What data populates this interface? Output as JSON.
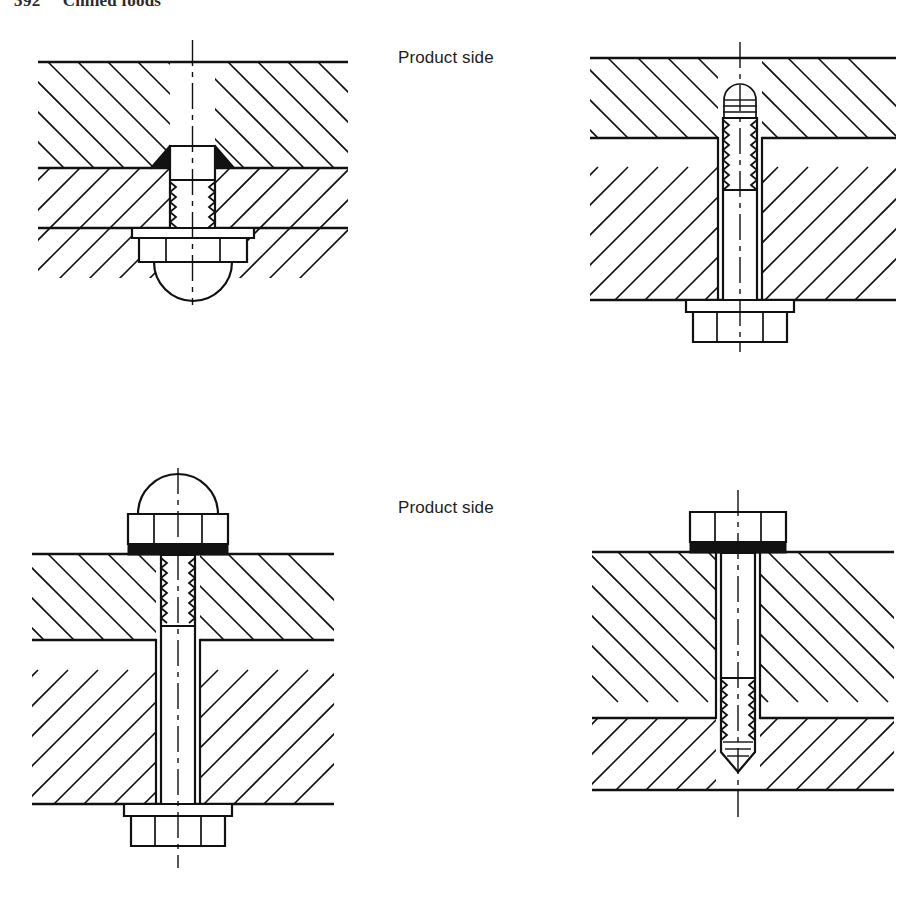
{
  "page": {
    "width": 911,
    "height": 902,
    "background": "#ffffff",
    "ink": "#111111",
    "seal_color": "#121212"
  },
  "running_head": {
    "folio": "392",
    "title": "Chilled foods"
  },
  "captions": {
    "top": "Product side",
    "bottom": "Product side"
  },
  "figures": [
    {
      "id": "top-left",
      "name": "countersunk-bolt-through-joint",
      "description": "Countersunk screw set flush with the product surface, sealing compound filling the countersink, threaded shank engaging a flanged domed cap nut on the underside.",
      "product_side": "top",
      "fastener": "countersunk screw",
      "head_type": "countersunk flush head",
      "nut_type": "flanged hexagon domed cap nut",
      "nut_position": "bottom",
      "sealing": "black sealing compound in countersink",
      "blind_hole": false,
      "hygienic": true
    },
    {
      "id": "top-right",
      "name": "stud-recessed-below-surface",
      "description": "Stud terminating below the product surface inside the upper plate with its rounded thread end set down in a blind recess, plain shank through the lower plate and a flanged hexagon nut beneath.",
      "product_side": "top",
      "fastener": "stud",
      "head_type": "rounded thread end, recessed",
      "nut_type": "flanged hexagon nut",
      "nut_position": "bottom",
      "sealing": "none",
      "blind_hole": true,
      "hygienic": true
    },
    {
      "id": "bottom-left",
      "name": "stud-with-domed-cap-nut",
      "description": "Stud passing through both plates, closed on the product side with a domed cap nut bedded on a sealing washer, and secured underneath with a flanged hexagon nut.",
      "product_side": "top",
      "fastener": "stud",
      "head_type": "domed cap nut",
      "nut_type": "flanged hexagon nut",
      "nut_position": "bottom",
      "sealing": "black sealing washer under cap nut",
      "blind_hole": false,
      "hygienic": true
    },
    {
      "id": "bottom-right",
      "name": "hex-bolt-into-blind-tapped-hole",
      "description": "Hexagon head bolt bedded on a sealing washer at the product surface, plain shank through the upper plate and threaded portion screwed into a blind tapped hole in the lower plate.",
      "product_side": "top",
      "fastener": "hexagon head bolt",
      "head_type": "hexagon head",
      "nut_type": "none",
      "nut_position": "none",
      "sealing": "black sealing washer under head",
      "blind_hole": true,
      "hygienic": true
    }
  ],
  "legend": {
    "hatching": "section hatching at 45 degrees, opposed between the two plates",
    "centreline": "chain-dashed centreline through each fastener axis"
  }
}
